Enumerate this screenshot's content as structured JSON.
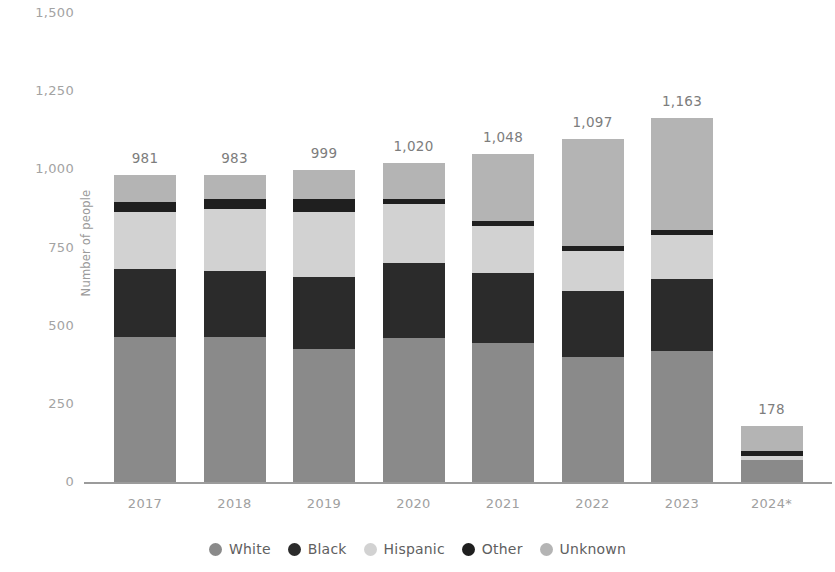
{
  "chart_data": {
    "type": "bar",
    "subtype": "stacked-bar",
    "title": "",
    "subtitle": "",
    "xlabel": "",
    "ylabel": "Number of people",
    "ylim": [
      0,
      1500
    ],
    "yticks": [
      "0",
      "250",
      "500",
      "750",
      "1,000",
      "1,250",
      "1,500"
    ],
    "ytick_values": [
      0,
      250,
      500,
      750,
      1000,
      1250,
      1500
    ],
    "grid": false,
    "legend_position": "bottom",
    "categories": [
      "2017",
      "2018",
      "2019",
      "2020",
      "2021",
      "2022",
      "2023",
      "2024*"
    ],
    "totals": [
      981,
      983,
      999,
      1020,
      1048,
      1097,
      1163,
      178
    ],
    "total_labels": [
      "981",
      "983",
      "999",
      "1,020",
      "1,048",
      "1,097",
      "1,163",
      "178"
    ],
    "series": [
      {
        "name": "White",
        "color": "#8a8a8a",
        "values": [
          463,
          463,
          425,
          460,
          445,
          400,
          420,
          70
        ]
      },
      {
        "name": "Black",
        "color": "#2b2b2b",
        "values": [
          217,
          212,
          230,
          240,
          225,
          210,
          230,
          0
        ]
      },
      {
        "name": "Hispanic",
        "color": "#d2d2d2",
        "values": [
          185,
          197,
          210,
          190,
          150,
          130,
          140,
          14
        ]
      },
      {
        "name": "Other",
        "color": "#1f1f1f",
        "values": [
          32,
          33,
          40,
          15,
          15,
          15,
          15,
          14
        ]
      },
      {
        "name": "Unknown",
        "color": "#b4b4b4",
        "values": [
          84,
          78,
          94,
          115,
          213,
          342,
          358,
          80
        ]
      }
    ]
  }
}
